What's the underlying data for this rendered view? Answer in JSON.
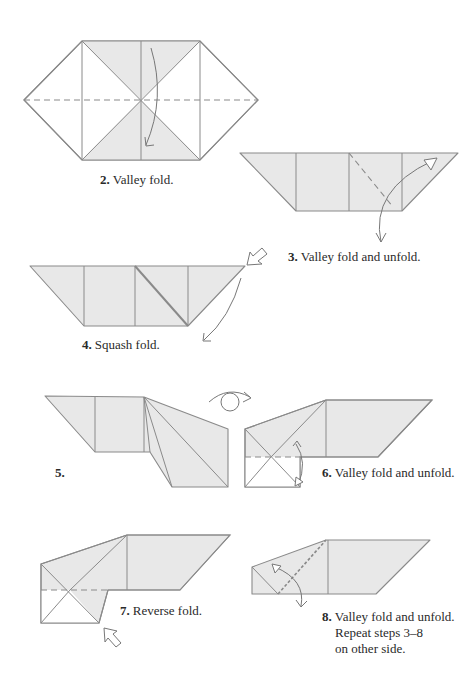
{
  "page": {
    "colors": {
      "paper_fill": "#e8e8e8",
      "line": "#8a8a8a",
      "arrow": "#777777",
      "text": "#2a2a2a",
      "background": "#ffffff"
    }
  },
  "steps": [
    {
      "number": "2.",
      "text": "Valley fold.",
      "icons": [
        "valley-fold-arrow-icon"
      ]
    },
    {
      "number": "3.",
      "text": "Valley fold and unfold.",
      "icons": [
        "valley-fold-unfold-arrow-icon"
      ]
    },
    {
      "number": "4.",
      "text": "Squash fold.",
      "icons": [
        "push-arrow-icon",
        "squash-curve-arrow-icon"
      ]
    },
    {
      "number": "5.",
      "text": "",
      "icons": [
        "turn-over-icon"
      ]
    },
    {
      "number": "6.",
      "text": "Valley fold and unfold.",
      "icons": [
        "valley-fold-unfold-arrow-icon"
      ]
    },
    {
      "number": "7.",
      "text": "Reverse fold.",
      "icons": [
        "push-arrow-icon"
      ]
    },
    {
      "number": "8.",
      "text": "Valley fold and unfold.",
      "line2": "Repeat steps 3–8",
      "line3": "on other side.",
      "icons": [
        "valley-fold-unfold-arrow-icon"
      ]
    }
  ]
}
